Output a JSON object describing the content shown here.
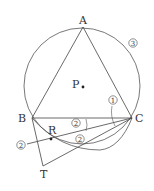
{
  "figure": {
    "points": {
      "A": {
        "label": "A"
      },
      "B": {
        "label": "B"
      },
      "C": {
        "label": "C"
      },
      "P": {
        "label": "P"
      },
      "R": {
        "label": "R"
      },
      "T": {
        "label": "T"
      }
    },
    "markers": {
      "m1": "1",
      "m2_line": "2",
      "m2_upper": "2",
      "m2_lower": "2",
      "m3": "3"
    },
    "colors": {
      "stroke": "#444444",
      "background": "#ffffff"
    }
  }
}
